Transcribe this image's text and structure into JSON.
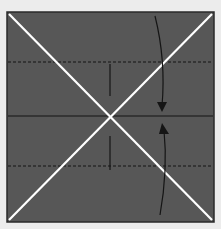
{
  "diagram": {
    "type": "origami-fold-diagram",
    "background_color": "#ececec",
    "paper_color": "#575757",
    "paper_border_color": "#2a2a2a",
    "crease_color": "#ffffff",
    "line_color": "#1a1a1a",
    "paper": {
      "x": 7,
      "y": 12,
      "width": 207,
      "height": 210
    },
    "diagonal_creases": [
      {
        "name": "diagonal-crease-tl-br",
        "x1": 9,
        "y1": 14,
        "x2": 212,
        "y2": 220
      },
      {
        "name": "diagonal-crease-tr-bl",
        "x1": 212,
        "y1": 14,
        "x2": 9,
        "y2": 220
      }
    ],
    "valley_fold_lines": [
      {
        "name": "valley-fold-line-top",
        "y": 62
      },
      {
        "name": "valley-fold-line-bottom",
        "y": 166
      }
    ],
    "center_line": {
      "x1": 8,
      "x2": 213,
      "y": 116
    },
    "center_ticks": [
      {
        "name": "center-tick-top",
        "x": 110,
        "y1": 64,
        "y2": 96
      },
      {
        "name": "center-tick-bottom",
        "x": 110,
        "y1": 136,
        "y2": 170
      }
    ],
    "fold_arrows": [
      {
        "name": "fold-arrow-down",
        "direction": "down"
      },
      {
        "name": "fold-arrow-up",
        "direction": "up"
      }
    ]
  }
}
